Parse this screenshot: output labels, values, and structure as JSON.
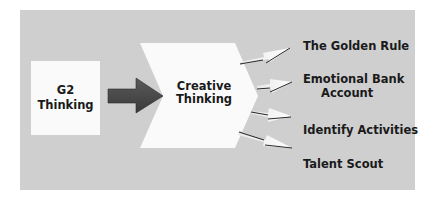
{
  "diagram": {
    "source": {
      "line1": "G2",
      "line2": "Thinking"
    },
    "center": {
      "line1": "Creative",
      "line2": "Thinking"
    },
    "outcomes": [
      {
        "line1": "The Golden Rule"
      },
      {
        "line1": "Emotional Bank",
        "line2": "Account"
      },
      {
        "line1": "Identify Activities"
      },
      {
        "line1": "Talent Scout"
      }
    ],
    "colors": {
      "panel": "#cfcfcf",
      "box": "#fafafa",
      "main_arrow": "#4a4a4a",
      "text": "#1a1a1a"
    }
  }
}
